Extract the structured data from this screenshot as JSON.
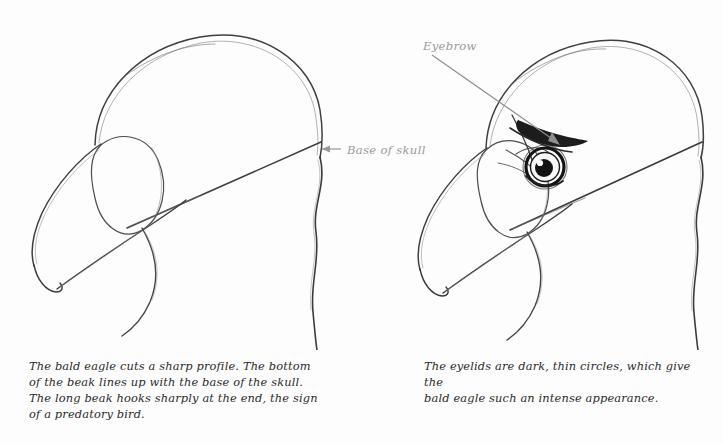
{
  "page": {
    "background_color": "#fdfdfd",
    "ink_color": "#4a4a4a",
    "dark_ink_color": "#1e1e1e",
    "annotation_color": "#9a9a9a",
    "caption_color": "#2b2b2b"
  },
  "figures": [
    {
      "id": "bald-eagle-head-construction",
      "name": "bald eagle head profile construction drawing",
      "caption": "The bald eagle cuts a sharp profile. The bottom\nof the beak lines up with the base of the skull.\nThe long beak hooks sharply at the end, the sign\nof a predatory bird.",
      "annotations": [
        {
          "name": "base-of-skull",
          "label": "Base of skull",
          "arrow": "points-left"
        }
      ]
    },
    {
      "id": "bald-eagle-head-eye-detail",
      "name": "bald eagle head with eye and eyebrow detail",
      "caption": "The eyelids are dark, thin circles, which give the\nbald eagle such an intense appearance.",
      "annotations": [
        {
          "name": "eyebrow",
          "label": "Eyebrow",
          "arrow": "points-down-right"
        }
      ]
    }
  ]
}
